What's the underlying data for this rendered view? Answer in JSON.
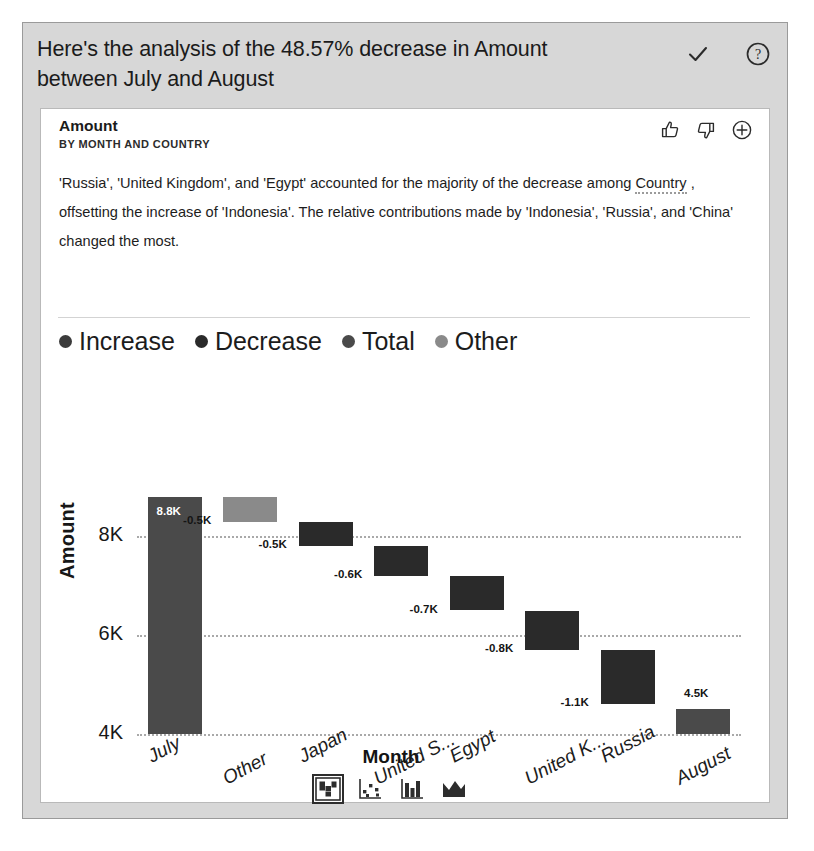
{
  "header": {
    "title": "Here's the analysis of the 48.57% decrease in Amount between July and August",
    "confirm_icon": "check-icon",
    "help_icon": "help-circle-icon"
  },
  "card": {
    "title": "Amount",
    "subtitle": "BY MONTH AND COUNTRY",
    "actions": {
      "like": "thumbs-up-icon",
      "dislike": "thumbs-down-icon",
      "add": "plus-circle-icon"
    },
    "narrative_parts": {
      "p1": "'Russia', 'United Kingdom', and 'Egypt' accounted for the majority of the decrease among ",
      "term": "Country",
      "p2": " , offsetting the increase of 'Indonesia'. The relative contributions made by 'Indonesia', 'Russia', and 'China' changed the most."
    }
  },
  "colors": {
    "increase": "#3b3b3b",
    "decrease": "#2a2a2a",
    "total": "#4a4a4a",
    "other": "#8a8a8a",
    "panel_bg": "#d7d7d7",
    "card_bg": "#ffffff",
    "grid": "#a9a9a9"
  },
  "chart_data": {
    "type": "bar",
    "chart_subtype": "waterfall",
    "title": "Amount",
    "xlabel": "Month",
    "ylabel": "Amount",
    "ylim": [
      4000,
      9000
    ],
    "yticks": [
      "4K",
      "6K",
      "8K"
    ],
    "ytick_values": [
      4000,
      6000,
      8000
    ],
    "grid": true,
    "legend": [
      {
        "label": "Increase",
        "color": "#3b3b3b"
      },
      {
        "label": "Decrease",
        "color": "#2a2a2a"
      },
      {
        "label": "Total",
        "color": "#4a4a4a"
      },
      {
        "label": "Other",
        "color": "#8a8a8a"
      }
    ],
    "legend_position": "top-left",
    "categories": [
      "July",
      "Other",
      "Japan",
      "United S...",
      "Egypt",
      "United K...",
      "Russia",
      "August"
    ],
    "full_categories": [
      "July",
      "Other",
      "Japan",
      "United States",
      "Egypt",
      "United Kingdom",
      "Russia",
      "August"
    ],
    "bars": [
      {
        "category": "July",
        "kind": "Total",
        "label": "8.8K",
        "value": 8800,
        "start": 4000,
        "end": 8800,
        "label_inside": true
      },
      {
        "category": "Other",
        "kind": "Other",
        "label": "-0.5K",
        "value": -500,
        "start": 8800,
        "end": 8300,
        "label_inside": false
      },
      {
        "category": "Japan",
        "kind": "Decrease",
        "label": "-0.5K",
        "value": -500,
        "start": 8300,
        "end": 7800,
        "label_inside": false
      },
      {
        "category": "United S...",
        "kind": "Decrease",
        "label": "-0.6K",
        "value": -600,
        "start": 7800,
        "end": 7200,
        "label_inside": false
      },
      {
        "category": "Egypt",
        "kind": "Decrease",
        "label": "-0.7K",
        "value": -700,
        "start": 7200,
        "end": 6500,
        "label_inside": false
      },
      {
        "category": "United K...",
        "kind": "Decrease",
        "label": "-0.8K",
        "value": -800,
        "start": 6500,
        "end": 5700,
        "label_inside": false
      },
      {
        "category": "Russia",
        "kind": "Decrease",
        "label": "-1.1K",
        "value": -1100,
        "start": 5700,
        "end": 4600,
        "label_inside": false
      },
      {
        "category": "August",
        "kind": "Total",
        "label": "4.5K",
        "value": 4500,
        "start": 4000,
        "end": 4500,
        "label_inside": false
      }
    ]
  },
  "chart_type_buttons": [
    {
      "name": "waterfall-chart-icon",
      "selected": true
    },
    {
      "name": "scatter-chart-icon",
      "selected": false
    },
    {
      "name": "column-chart-icon",
      "selected": false
    },
    {
      "name": "area-chart-icon",
      "selected": false
    }
  ]
}
